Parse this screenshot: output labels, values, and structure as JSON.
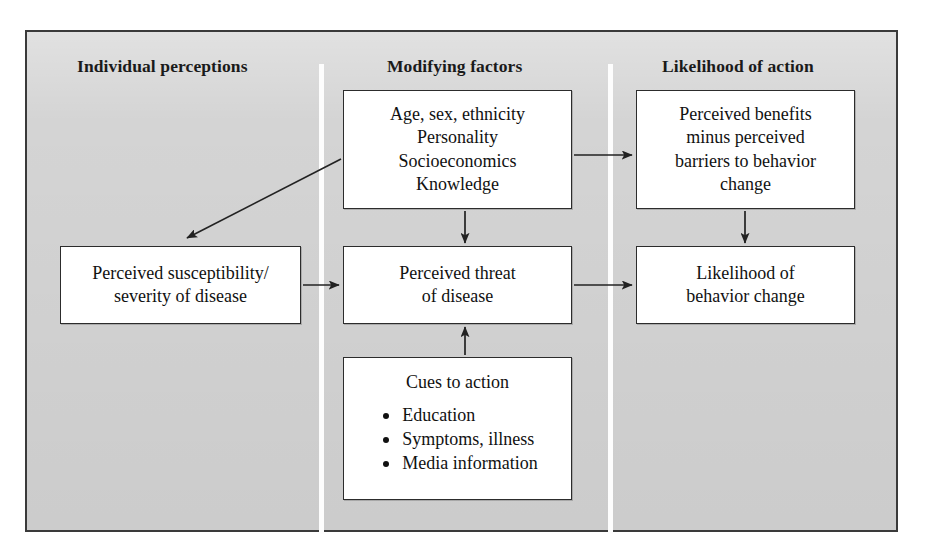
{
  "diagram": {
    "type": "flow-diagram",
    "frame_color": "#d4d4d4",
    "border_color": "#2c2c2c",
    "box_fill": "#ffffff",
    "divider_color": "#fdfdfd",
    "columns": [
      {
        "id": "individual-perceptions",
        "label": "Individual perceptions"
      },
      {
        "id": "modifying-factors",
        "label": "Modifying factors"
      },
      {
        "id": "likelihood-of-action",
        "label": "Likelihood of action"
      }
    ],
    "nodes": {
      "modifying": {
        "id": "modifying-factors-box",
        "lines": [
          "Age, sex, ethnicity",
          "Personality",
          "Socioeconomics",
          "Knowledge"
        ]
      },
      "benefits": {
        "id": "perceived-benefits-box",
        "lines": [
          "Perceived benefits",
          "minus perceived",
          "barriers to behavior",
          "change"
        ]
      },
      "susceptibility": {
        "id": "perceived-susceptibility-box",
        "lines": [
          "Perceived susceptibility/",
          "severity of disease"
        ]
      },
      "threat": {
        "id": "perceived-threat-box",
        "lines": [
          "Perceived threat",
          "of disease"
        ]
      },
      "likelihood": {
        "id": "likelihood-behavior-change-box",
        "lines": [
          "Likelihood of",
          "behavior change"
        ]
      },
      "cues": {
        "id": "cues-to-action-box",
        "title": "Cues to action",
        "bullets": [
          "Education",
          "Symptoms, illness",
          "Media information"
        ]
      }
    },
    "arrows": [
      {
        "name": "modifying-to-susceptibility",
        "from": "modifying",
        "to": "susceptibility",
        "style": "diagonal"
      },
      {
        "name": "modifying-to-benefits",
        "from": "modifying",
        "to": "benefits",
        "style": "horizontal"
      },
      {
        "name": "modifying-to-threat",
        "from": "modifying",
        "to": "threat",
        "style": "vertical-down"
      },
      {
        "name": "susceptibility-to-threat",
        "from": "susceptibility",
        "to": "threat",
        "style": "horizontal"
      },
      {
        "name": "threat-to-likelihood",
        "from": "threat",
        "to": "likelihood",
        "style": "horizontal"
      },
      {
        "name": "benefits-to-likelihood",
        "from": "benefits",
        "to": "likelihood",
        "style": "vertical-down"
      },
      {
        "name": "cues-to-threat",
        "from": "cues",
        "to": "threat",
        "style": "vertical-up"
      }
    ]
  }
}
